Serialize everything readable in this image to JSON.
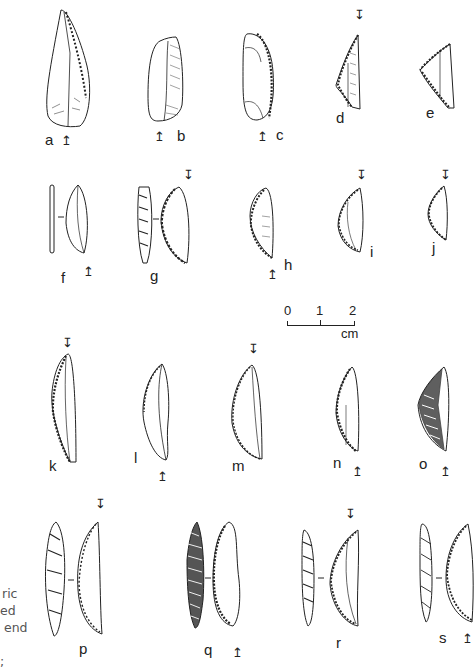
{
  "figure": {
    "artifacts": [
      {
        "id": "a",
        "label": "a",
        "orientation_arrow": "↥"
      },
      {
        "id": "b",
        "label": "b",
        "orientation_arrow": "↥"
      },
      {
        "id": "c",
        "label": "c",
        "orientation_arrow": "↥"
      },
      {
        "id": "d",
        "label": "d",
        "orientation_arrow": "↧"
      },
      {
        "id": "e",
        "label": "e",
        "orientation_arrow": ""
      },
      {
        "id": "f",
        "label": "f",
        "orientation_arrow": "↥"
      },
      {
        "id": "g",
        "label": "g",
        "orientation_arrow": "↧"
      },
      {
        "id": "h",
        "label": "h",
        "orientation_arrow": "↥"
      },
      {
        "id": "i",
        "label": "i",
        "orientation_arrow": "↧"
      },
      {
        "id": "j",
        "label": "j",
        "orientation_arrow": "↧"
      },
      {
        "id": "k",
        "label": "k",
        "orientation_arrow": "↧"
      },
      {
        "id": "l",
        "label": "l",
        "orientation_arrow": "↥"
      },
      {
        "id": "m",
        "label": "m",
        "orientation_arrow": "↧"
      },
      {
        "id": "n",
        "label": "n",
        "orientation_arrow": "↥"
      },
      {
        "id": "o",
        "label": "o",
        "orientation_arrow": "↥"
      },
      {
        "id": "p",
        "label": "p",
        "orientation_arrow": "↧"
      },
      {
        "id": "q",
        "label": "q",
        "orientation_arrow": "↥"
      },
      {
        "id": "r",
        "label": "r",
        "orientation_arrow": "↧"
      },
      {
        "id": "s",
        "label": "s",
        "orientation_arrow": "↥"
      }
    ],
    "scale_bar": {
      "ticks": [
        "0",
        "1",
        "2"
      ],
      "unit": "cm"
    },
    "caption_fragments": [
      "ric",
      "ed",
      "end",
      "",
      ";"
    ]
  }
}
